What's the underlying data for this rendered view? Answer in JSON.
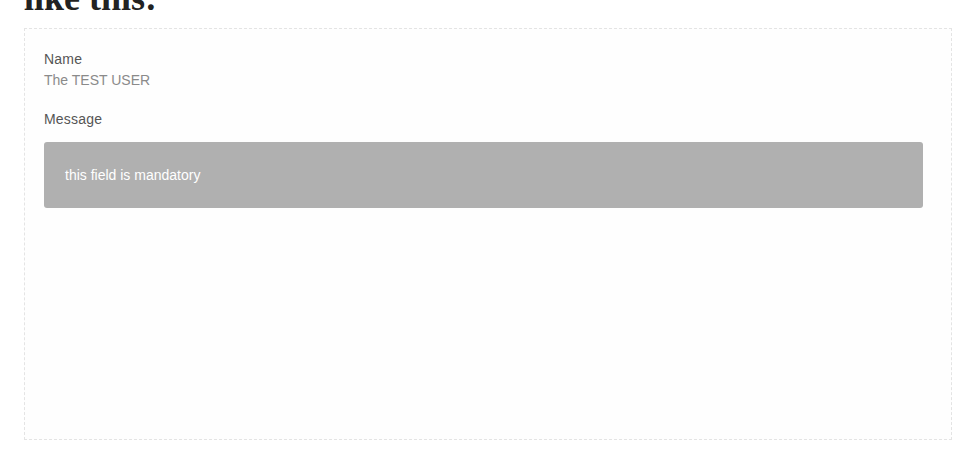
{
  "page": {
    "heading_fragment": "like this:"
  },
  "form_preview": {
    "name": {
      "label": "Name",
      "value": "The TEST USER"
    },
    "message": {
      "label": "Message",
      "notice": "this field is mandatory"
    }
  },
  "colors": {
    "notice_background": "#b0b0b0",
    "notice_text": "#ffffff",
    "label_text": "#555555",
    "value_text": "#8a8a8a"
  }
}
